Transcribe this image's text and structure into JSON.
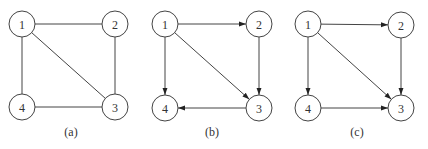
{
  "diagrams": [
    {
      "id": "a",
      "caption": "(a)",
      "directed": false,
      "caption_pos": [
        71,
        136
      ],
      "nodes": [
        {
          "label": "1",
          "x": 22,
          "y": 24
        },
        {
          "label": "2",
          "x": 115,
          "y": 24
        },
        {
          "label": "3",
          "x": 115,
          "y": 107
        },
        {
          "label": "4",
          "x": 22,
          "y": 107
        }
      ],
      "edges": [
        [
          "1",
          "2"
        ],
        [
          "1",
          "3"
        ],
        [
          "1",
          "4"
        ],
        [
          "2",
          "3"
        ],
        [
          "4",
          "3"
        ]
      ]
    },
    {
      "id": "b",
      "caption": "(b)",
      "directed": true,
      "caption_pos": [
        212,
        136
      ],
      "nodes": [
        {
          "label": "1",
          "x": 165,
          "y": 24
        },
        {
          "label": "2",
          "x": 259,
          "y": 24
        },
        {
          "label": "3",
          "x": 259,
          "y": 108
        },
        {
          "label": "4",
          "x": 165,
          "y": 108
        }
      ],
      "edges": [
        [
          "1",
          "2"
        ],
        [
          "1",
          "3"
        ],
        [
          "1",
          "4"
        ],
        [
          "2",
          "3"
        ],
        [
          "3",
          "4"
        ]
      ]
    },
    {
      "id": "c",
      "caption": "(c)",
      "directed": true,
      "caption_pos": [
        357,
        136
      ],
      "nodes": [
        {
          "label": "1",
          "x": 308,
          "y": 24
        },
        {
          "label": "2",
          "x": 401,
          "y": 25
        },
        {
          "label": "3",
          "x": 401,
          "y": 108
        },
        {
          "label": "4",
          "x": 308,
          "y": 108
        }
      ],
      "edges": [
        [
          "1",
          "2"
        ],
        [
          "1",
          "3"
        ],
        [
          "1",
          "4"
        ],
        [
          "2",
          "3"
        ],
        [
          "4",
          "3"
        ]
      ]
    }
  ],
  "style": {
    "node_radius": 13,
    "stroke_color": "#444444",
    "background": "#ffffff"
  }
}
